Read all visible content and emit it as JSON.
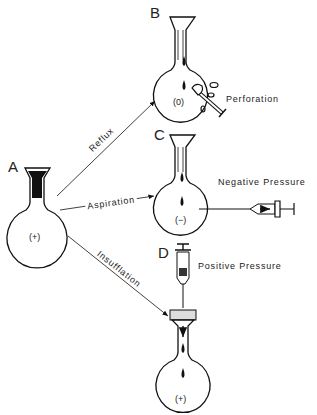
{
  "diagram": {
    "panels": {
      "A": {
        "letter": "A",
        "sign": "(+)"
      },
      "B": {
        "letter": "B",
        "sign": "(0)",
        "annotation": "Perforation"
      },
      "C": {
        "letter": "C",
        "sign": "(−)",
        "annotation": "Negative Pressure"
      },
      "D": {
        "letter": "D",
        "sign": "(+)",
        "annotation": "Positive Pressure"
      }
    },
    "arrows": {
      "reflux": "Reflux",
      "aspiration": "Aspiration",
      "insufflation": "Insufflation"
    },
    "colors": {
      "ink": "#111111",
      "background": "#ffffff"
    }
  }
}
